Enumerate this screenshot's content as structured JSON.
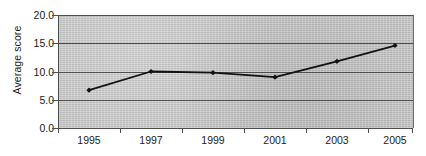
{
  "chart_data": {
    "type": "line",
    "title": "",
    "xlabel": "",
    "ylabel": "Average score",
    "categories": [
      "1995",
      "1997",
      "1999",
      "2001",
      "2003",
      "2005"
    ],
    "x": [
      1995,
      1997,
      1999,
      2001,
      2003,
      2005
    ],
    "values": [
      6.7,
      10.0,
      9.8,
      9.0,
      11.8,
      14.6
    ],
    "series": [
      {
        "name": "Average score",
        "values": [
          6.7,
          10.0,
          9.8,
          9.0,
          11.8,
          14.6
        ]
      }
    ],
    "ylim": [
      0.0,
      20.0
    ],
    "yticks": [
      "0.0",
      "5.0",
      "10.0",
      "15.0",
      "20.0"
    ],
    "ytick_values": [
      0.0,
      5.0,
      10.0,
      15.0,
      20.0
    ],
    "xticks": [
      "1995",
      "1997",
      "1999",
      "2001",
      "2003",
      "2005"
    ],
    "grid": "horizontal",
    "legend": "none",
    "marker": "diamond",
    "line_color": "#111111",
    "marker_color": "#111111",
    "plot_background": "#c9c9c9",
    "gridline_color": "#4f4f4f",
    "page_background": "#ffffff"
  }
}
